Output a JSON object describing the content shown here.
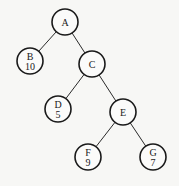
{
  "diagram": {
    "type": "binary-tree",
    "style": {
      "background": "#f7f7f5",
      "stroke": "#1a1a1a",
      "node_radius": 13
    },
    "nodes": [
      {
        "id": "A",
        "label": "A",
        "weight": null,
        "x": 65,
        "y": 22
      },
      {
        "id": "B",
        "label": "B",
        "weight": "10",
        "x": 30,
        "y": 61
      },
      {
        "id": "C",
        "label": "C",
        "weight": null,
        "x": 92,
        "y": 64
      },
      {
        "id": "D",
        "label": "D",
        "weight": "5",
        "x": 58,
        "y": 109
      },
      {
        "id": "E",
        "label": "E",
        "weight": null,
        "x": 123,
        "y": 112
      },
      {
        "id": "F",
        "label": "F",
        "weight": "9",
        "x": 88,
        "y": 157
      },
      {
        "id": "G",
        "label": "G",
        "weight": "7",
        "x": 153,
        "y": 157
      }
    ],
    "edges": [
      {
        "from": "A",
        "to": "B"
      },
      {
        "from": "A",
        "to": "C"
      },
      {
        "from": "C",
        "to": "D"
      },
      {
        "from": "C",
        "to": "E"
      },
      {
        "from": "E",
        "to": "F"
      },
      {
        "from": "E",
        "to": "G"
      }
    ]
  }
}
